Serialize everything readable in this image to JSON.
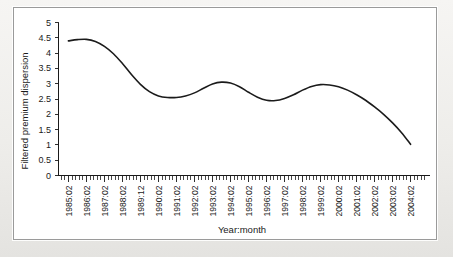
{
  "figure": {
    "background_color": "#ffffff",
    "frame_color": "#9a9a9a",
    "page_color": "#efeeec"
  },
  "chart_data": {
    "type": "line",
    "title": "",
    "subtitle": "",
    "xlabel": "Year:month",
    "ylabel": "Filtered premium dispersion",
    "line_color": "#1b1b1b",
    "grid": false,
    "legend": false,
    "legend_position": "none",
    "ylim": [
      0,
      5
    ],
    "ytick_labels": [
      "0",
      "0.5",
      "1",
      "1.5",
      "2",
      "2.5",
      "3",
      "3.5",
      "4",
      "4.5",
      "5"
    ],
    "ytick_values": [
      0,
      0.5,
      1,
      1.5,
      2,
      2.5,
      3,
      3.5,
      4,
      4.5,
      5
    ],
    "xtick_labels": [
      "1985:02",
      "1986:02",
      "1987:02",
      "1988:02",
      "1989:12",
      "1990:02",
      "1991:02",
      "1992:02",
      "1993:02",
      "1994:02",
      "1995:02",
      "1996:02",
      "1997:02",
      "1998:02",
      "1999:02",
      "2000:02",
      "2001:02",
      "2002:02",
      "2003:02",
      "2004:02"
    ],
    "x_minor_ticks_per_interval": 4,
    "series": [
      {
        "name": "Filtered premium dispersion",
        "x": [
          "1985:02",
          "1985:08",
          "1986:02",
          "1986:08",
          "1987:02",
          "1987:08",
          "1988:02",
          "1988:08",
          "1989:12",
          "1989:08",
          "1990:02",
          "1990:08",
          "1991:02",
          "1991:08",
          "1992:02",
          "1992:08",
          "1993:02",
          "1993:08",
          "1994:02",
          "1994:08",
          "1995:02",
          "1995:08",
          "1996:02",
          "1996:08",
          "1997:02",
          "1997:08",
          "1998:02",
          "1998:08",
          "1999:02",
          "1999:08",
          "2000:02",
          "2000:08",
          "2001:02",
          "2001:08",
          "2002:02",
          "2002:08",
          "2003:02",
          "2003:08",
          "2004:02"
        ],
        "values": [
          4.4,
          4.44,
          4.45,
          4.38,
          4.22,
          3.98,
          3.66,
          3.3,
          2.98,
          2.74,
          2.6,
          2.55,
          2.55,
          2.6,
          2.7,
          2.85,
          2.99,
          3.05,
          3.02,
          2.9,
          2.72,
          2.56,
          2.46,
          2.45,
          2.52,
          2.64,
          2.79,
          2.91,
          2.97,
          2.96,
          2.9,
          2.79,
          2.64,
          2.46,
          2.24,
          2.0,
          1.72,
          1.4,
          1.02
        ]
      }
    ],
    "annotations": []
  }
}
